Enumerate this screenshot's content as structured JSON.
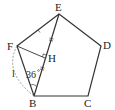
{
  "diagram": {
    "type": "geometry",
    "points": {
      "E": {
        "label": "E",
        "x": 59,
        "y": 14
      },
      "D": {
        "label": "D",
        "x": 101,
        "y": 46
      },
      "C": {
        "label": "C",
        "x": 88,
        "y": 96
      },
      "B": {
        "label": "B",
        "x": 34,
        "y": 96
      },
      "F": {
        "label": "F",
        "x": 17,
        "y": 46
      },
      "H": {
        "label": "H",
        "x": 45,
        "y": 58
      }
    },
    "angle_label": "36°",
    "arc_label": "l",
    "labels": {
      "E": "E",
      "D": "D",
      "C": "C",
      "B": "B",
      "F": "F",
      "H": "H",
      "angle": "36",
      "arc": "l"
    },
    "colors": {
      "line": "#333333",
      "dashed": "#888888"
    }
  }
}
